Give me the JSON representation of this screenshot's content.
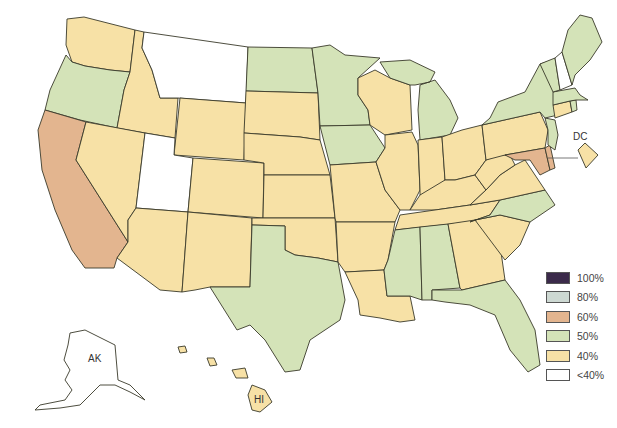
{
  "map": {
    "labels": {
      "dc": "DC",
      "ak": "AK",
      "hi": "HI"
    },
    "colors": {
      "c100": "#3b2a4a",
      "c80": "#cdd8d2",
      "c60": "#e3b58f",
      "c50": "#d4e3b8",
      "c40": "#f7e1a6",
      "lt40": "#ffffff"
    },
    "states": {
      "WA": "40%",
      "OR": "50%",
      "CA": "60%",
      "ID": "40%",
      "NV": "40%",
      "MT": "<40%",
      "WY": "40%",
      "UT": "<40%",
      "AZ": "40%",
      "CO": "40%",
      "NM": "40%",
      "ND": "50%",
      "SD": "40%",
      "NE": "40%",
      "KS": "40%",
      "OK": "40%",
      "TX": "50%",
      "MN": "50%",
      "IA": "50%",
      "MO": "40%",
      "AR": "40%",
      "LA": "40%",
      "WI": "40%",
      "IL": "40%",
      "MI": "50%",
      "IN": "40%",
      "OH": "40%",
      "KY": "40%",
      "TN": "40%",
      "MS": "50%",
      "AL": "50%",
      "GA": "40%",
      "FL": "50%",
      "SC": "40%",
      "NC": "50%",
      "VA": "40%",
      "WV": "40%",
      "PA": "40%",
      "NY": "50%",
      "VT": "50%",
      "NH": "<40%",
      "ME": "50%",
      "MA": "50%",
      "CT": "40%",
      "RI": "50%",
      "NJ": "50%",
      "DE": "60%",
      "MD": "60%",
      "DC": "40%",
      "AK": "<40%",
      "HI": "40%"
    }
  },
  "legend": {
    "items": [
      {
        "label": "100%",
        "color": "#3b2a4a"
      },
      {
        "label": "80%",
        "color": "#cdd8d2"
      },
      {
        "label": "60%",
        "color": "#e3b58f"
      },
      {
        "label": "50%",
        "color": "#d4e3b8"
      },
      {
        "label": "40%",
        "color": "#f7e1a6"
      },
      {
        "label": "<40%",
        "color": "#ffffff"
      }
    ]
  }
}
